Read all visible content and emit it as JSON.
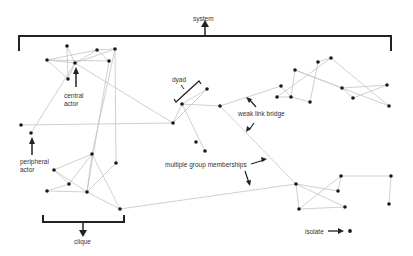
{
  "labels": {
    "system": "system",
    "central_actor_1": "central",
    "central_actor_2": "actor",
    "dyad": "dyad",
    "weak_link_bridge": "weak link bridge",
    "peripheral_actor_1": "peripheral",
    "peripheral_actor_2": "actor",
    "multiple_group_memberships": "multiple group memberships",
    "clique": "clique",
    "isolate": "isolate"
  },
  "colors": {
    "edge": "#c4c4c4",
    "node": "#1a1a1a",
    "annotation": "#222222",
    "background": "#ffffff"
  },
  "nodes": [
    {
      "id": "A",
      "x": 67,
      "y": 46
    },
    {
      "id": "B",
      "x": 47,
      "y": 60
    },
    {
      "id": "C",
      "x": 75,
      "y": 63
    },
    {
      "id": "D",
      "x": 97,
      "y": 50
    },
    {
      "id": "E",
      "x": 115,
      "y": 49
    },
    {
      "id": "F",
      "x": 109,
      "y": 61
    },
    {
      "id": "G",
      "x": 68,
      "y": 79
    },
    {
      "id": "H",
      "x": 21,
      "y": 125
    },
    {
      "id": "I",
      "x": 31,
      "y": 133
    },
    {
      "id": "J",
      "x": 92,
      "y": 154
    },
    {
      "id": "K",
      "x": 116,
      "y": 163
    },
    {
      "id": "L",
      "x": 54,
      "y": 170
    },
    {
      "id": "M",
      "x": 69,
      "y": 184
    },
    {
      "id": "N",
      "x": 47,
      "y": 191
    },
    {
      "id": "O",
      "x": 87,
      "y": 192
    },
    {
      "id": "P",
      "x": 120,
      "y": 209
    },
    {
      "id": "Q",
      "x": 173,
      "y": 123
    },
    {
      "id": "R",
      "x": 182,
      "y": 104
    },
    {
      "id": "S",
      "x": 207,
      "y": 89
    },
    {
      "id": "T",
      "x": 220,
      "y": 106
    },
    {
      "id": "U",
      "x": 196,
      "y": 142
    },
    {
      "id": "V",
      "x": 205,
      "y": 151
    },
    {
      "id": "W",
      "x": 281,
      "y": 86
    },
    {
      "id": "X",
      "x": 277,
      "y": 97
    },
    {
      "id": "Y",
      "x": 291,
      "y": 97
    },
    {
      "id": "Z",
      "x": 295,
      "y": 70
    },
    {
      "id": "AA",
      "x": 310,
      "y": 102
    },
    {
      "id": "AB",
      "x": 318,
      "y": 62
    },
    {
      "id": "AC",
      "x": 331,
      "y": 58
    },
    {
      "id": "AD",
      "x": 342,
      "y": 88
    },
    {
      "id": "AE",
      "x": 353,
      "y": 98
    },
    {
      "id": "AF",
      "x": 387,
      "y": 85
    },
    {
      "id": "AG",
      "x": 389,
      "y": 106
    },
    {
      "id": "BA",
      "x": 296,
      "y": 184
    },
    {
      "id": "BB",
      "x": 341,
      "y": 176
    },
    {
      "id": "BC",
      "x": 338,
      "y": 191
    },
    {
      "id": "BD",
      "x": 299,
      "y": 209
    },
    {
      "id": "BE",
      "x": 345,
      "y": 207
    },
    {
      "id": "BF",
      "x": 391,
      "y": 176
    },
    {
      "id": "BG",
      "x": 389,
      "y": 204
    },
    {
      "id": "ISO",
      "x": 350,
      "y": 231
    }
  ],
  "edges": [
    [
      "A",
      "C"
    ],
    [
      "A",
      "G"
    ],
    [
      "B",
      "C"
    ],
    [
      "B",
      "D"
    ],
    [
      "B",
      "G"
    ],
    [
      "B",
      "F"
    ],
    [
      "C",
      "D"
    ],
    [
      "C",
      "E"
    ],
    [
      "D",
      "E"
    ],
    [
      "D",
      "F"
    ],
    [
      "C",
      "G"
    ],
    [
      "C",
      "Q"
    ],
    [
      "E",
      "K"
    ],
    [
      "E",
      "J"
    ],
    [
      "F",
      "O"
    ],
    [
      "H",
      "Q"
    ],
    [
      "I",
      "C"
    ],
    [
      "J",
      "L"
    ],
    [
      "J",
      "M"
    ],
    [
      "J",
      "O"
    ],
    [
      "J",
      "P"
    ],
    [
      "K",
      "O"
    ],
    [
      "L",
      "O"
    ],
    [
      "L",
      "M"
    ],
    [
      "M",
      "N"
    ],
    [
      "N",
      "O"
    ],
    [
      "O",
      "P"
    ],
    [
      "P",
      "BA"
    ],
    [
      "Q",
      "R"
    ],
    [
      "Q",
      "S"
    ],
    [
      "R",
      "T"
    ],
    [
      "R",
      "V"
    ],
    [
      "T",
      "BA"
    ],
    [
      "T",
      "W"
    ],
    [
      "S",
      "R"
    ],
    [
      "W",
      "Y"
    ],
    [
      "X",
      "Y"
    ],
    [
      "Y",
      "Z"
    ],
    [
      "Y",
      "AA"
    ],
    [
      "Z",
      "AD"
    ],
    [
      "AA",
      "AB"
    ],
    [
      "AB",
      "AC"
    ],
    [
      "X",
      "AC"
    ],
    [
      "AC",
      "AG"
    ],
    [
      "AD",
      "AF"
    ],
    [
      "AE",
      "AF"
    ],
    [
      "AD",
      "AE"
    ],
    [
      "Z",
      "AG"
    ],
    [
      "BA",
      "BD"
    ],
    [
      "BA",
      "BC"
    ],
    [
      "BA",
      "BE"
    ],
    [
      "BB",
      "BD"
    ],
    [
      "BD",
      "BE"
    ],
    [
      "BB",
      "BC"
    ],
    [
      "BB",
      "BF"
    ],
    [
      "BF",
      "BG"
    ]
  ]
}
